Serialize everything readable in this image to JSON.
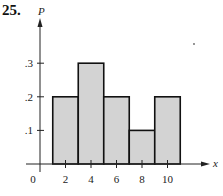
{
  "problem": {
    "number": "25."
  },
  "chart_data": {
    "type": "bar",
    "title": "",
    "xlabel": "x",
    "ylabel": "P",
    "bin_edges": [
      1,
      3,
      5,
      7,
      9,
      11
    ],
    "categories": [
      "2",
      "4",
      "6",
      "8",
      "10"
    ],
    "x": [
      2,
      4,
      6,
      8,
      10
    ],
    "values": [
      0.2,
      0.3,
      0.2,
      0.1,
      0.2
    ],
    "xticks": [
      "0",
      "2",
      "4",
      "6",
      "8",
      "10"
    ],
    "yticks": [
      ".1",
      ".2",
      ".3"
    ],
    "ylim": [
      0,
      0.4
    ],
    "xlim": [
      0,
      12
    ],
    "grid": false,
    "legend": null,
    "bar_color": "#d3d3d3",
    "edge_color": "#111111"
  }
}
